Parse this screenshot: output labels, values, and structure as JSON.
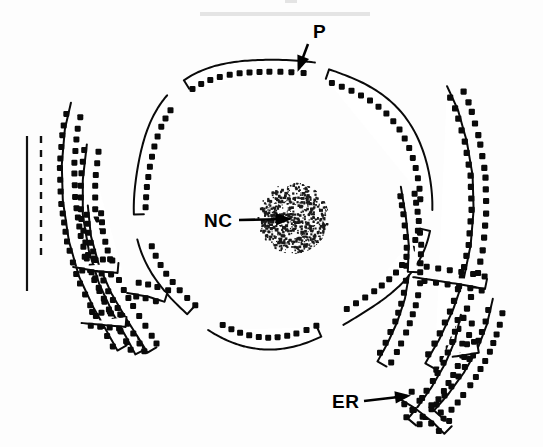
{
  "figure": {
    "kind": "line-drawing-diagram",
    "background_color": "#fdfdfd",
    "ink_color": "#0a0a0a"
  },
  "labels": [
    {
      "id": "pore",
      "text": "P",
      "meaning": "nuclear pore",
      "text_x": 313,
      "text_y": 38,
      "leader": {
        "x1": 308,
        "y1": 44,
        "x2": 299,
        "y2": 68
      },
      "arrow_angle_deg": 110
    },
    {
      "id": "nucleolus",
      "text": "NC",
      "meaning": "nucleolus",
      "text_x": 204,
      "text_y": 227,
      "leader": {
        "x1": 239,
        "y1": 220,
        "x2": 288,
        "y2": 219
      },
      "arrow_angle_deg": 0
    },
    {
      "id": "er",
      "text": "ER",
      "meaning": "endoplasmic reticulum",
      "text_x": 332,
      "text_y": 408,
      "leader": {
        "x1": 364,
        "y1": 401,
        "x2": 407,
        "y2": 396
      },
      "arrow_angle_deg": -8
    }
  ],
  "scale_bars": [
    {
      "id": "solid-scale-bar",
      "style": "solid",
      "x": 27,
      "y1": 136,
      "y2": 291
    },
    {
      "id": "dashed-scale-bar",
      "style": "dashed",
      "x": 41,
      "y1": 136,
      "y2": 256
    }
  ],
  "nucleolus": {
    "center_x": 293,
    "center_y": 218,
    "radius": 36,
    "texture": "stipple",
    "dot_count": 560
  },
  "nuclear_envelope": {
    "shape": "oval",
    "center_x": 280,
    "center_y": 200,
    "pore_count": 6,
    "ribosomes_on_outer_face": true
  },
  "chart_data": {
    "type": "diagram",
    "title": "",
    "structures": [
      {
        "name": "nucleus",
        "label": "",
        "count": 1
      },
      {
        "name": "nuclear pore",
        "label": "P",
        "count": 6
      },
      {
        "name": "nucleolus",
        "label": "NC",
        "count": 1
      },
      {
        "name": "rough endoplasmic reticulum cisterna",
        "label": "ER",
        "count": 8
      }
    ]
  }
}
